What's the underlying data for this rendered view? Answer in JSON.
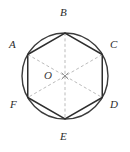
{
  "figure": {
    "kind": "geometry-diagram",
    "width": 130,
    "height": 152,
    "colors": {
      "background": "#ffffff",
      "circle_stroke": "#3c3c3c",
      "hexagon_stroke": "#2e2e2e",
      "diagonal_stroke": "#b0b0b0",
      "label_color": "#2b2b2b",
      "center_mark": "#8a8a8a"
    },
    "circle": {
      "center_x": 65,
      "center_y": 76,
      "radius": 43,
      "stroke_width": 1.4
    },
    "center_point": {
      "id": "O",
      "label": "O",
      "x": 65,
      "y": 76,
      "label_x": 44,
      "label_y": 70
    },
    "vertices": [
      {
        "id": "A",
        "label": "A",
        "angle_deg": 150,
        "x": 27.75,
        "y": 54.5,
        "label_x": 9,
        "label_y": 39
      },
      {
        "id": "B",
        "label": "B",
        "angle_deg": 90,
        "x": 65.0,
        "y": 33.0,
        "label_x": 60,
        "label_y": 7
      },
      {
        "id": "C",
        "label": "C",
        "angle_deg": 30,
        "x": 102.25,
        "y": 54.5,
        "label_x": 110,
        "label_y": 39
      },
      {
        "id": "D",
        "label": "D",
        "angle_deg": 330,
        "x": 102.25,
        "y": 97.5,
        "label_x": 110,
        "label_y": 99
      },
      {
        "id": "E",
        "label": "E",
        "angle_deg": 270,
        "x": 65.0,
        "y": 119.0,
        "label_x": 60,
        "label_y": 131
      },
      {
        "id": "F",
        "label": "F",
        "angle_deg": 210,
        "x": 27.75,
        "y": 97.5,
        "label_x": 10,
        "label_y": 99
      }
    ],
    "hexagon_edges": [
      {
        "from": "A",
        "to": "B"
      },
      {
        "from": "B",
        "to": "C"
      },
      {
        "from": "C",
        "to": "D"
      },
      {
        "from": "D",
        "to": "E"
      },
      {
        "from": "E",
        "to": "F"
      },
      {
        "from": "F",
        "to": "A"
      }
    ],
    "diagonals": [
      {
        "from": "A",
        "to": "D",
        "style": "dashed"
      },
      {
        "from": "B",
        "to": "E",
        "style": "dashed"
      },
      {
        "from": "C",
        "to": "F",
        "style": "dashed"
      }
    ]
  }
}
